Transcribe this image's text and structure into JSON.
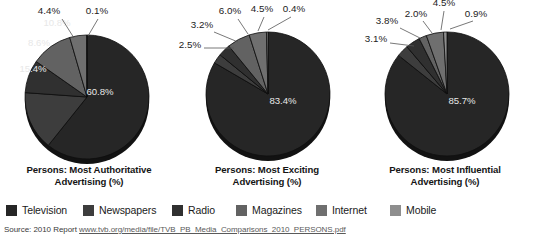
{
  "figure": {
    "source_prefix": "Source:  2010 Report",
    "source_url": "www.tvb.org/media/file/TVB_PB_Media_Comparisons_2010_PERSONS.pdf"
  },
  "legend": {
    "items": [
      {
        "label": "Television",
        "color": "#262626"
      },
      {
        "label": "Newspapers",
        "color": "#3d3d3d"
      },
      {
        "label": "Radio",
        "color": "#303030"
      },
      {
        "label": "Magazines",
        "color": "#626262"
      },
      {
        "label": "Internet",
        "color": "#6f6f6f"
      },
      {
        "label": "Mobile",
        "color": "#8e8e8e"
      }
    ]
  },
  "chart_data": [
    {
      "type": "pie",
      "title": "Persons: Most Authoritative\nAdvertising (%)",
      "title_line1": "Persons: Most Authoritative",
      "title_line2": "Advertising (%)",
      "categories": [
        "Television",
        "Newspapers",
        "Radio",
        "Magazines",
        "Internet",
        "Mobile"
      ],
      "values": [
        60.8,
        15.4,
        8.6,
        10.8,
        4.4,
        0.1
      ],
      "labels": [
        "60.8%",
        "15.4%",
        "8.6%",
        "10.8%",
        "4.4%",
        "0.1%"
      ],
      "colors": [
        "#262626",
        "#3d3d3d",
        "#303030",
        "#626262",
        "#6f6f6f",
        "#8e8e8e"
      ],
      "legend_position": "bottom-shared",
      "start_angle_deg": 0
    },
    {
      "type": "pie",
      "title": "Persons: Most Exciting\nAdvertising (%)",
      "title_line1": "Persons: Most Exciting",
      "title_line2": "Advertising (%)",
      "categories": [
        "Television",
        "Newspapers",
        "Radio",
        "Magazines",
        "Internet",
        "Mobile"
      ],
      "values": [
        83.4,
        2.5,
        3.2,
        6.0,
        4.5,
        0.4
      ],
      "labels": [
        "83.4%",
        "2.5%",
        "3.2%",
        "6.0%",
        "4.5%",
        "0.4%"
      ],
      "colors": [
        "#262626",
        "#3d3d3d",
        "#303030",
        "#626262",
        "#6f6f6f",
        "#8e8e8e"
      ],
      "legend_position": "bottom-shared",
      "start_angle_deg": 0
    },
    {
      "type": "pie",
      "title": "Persons: Most Influential\nAdvertising (%)",
      "title_line1": "Persons: Most Influential",
      "title_line2": "Advertising (%)",
      "categories": [
        "Television",
        "Newspapers",
        "Radio",
        "Magazines",
        "Internet",
        "Mobile"
      ],
      "values": [
        85.7,
        3.1,
        3.8,
        2.0,
        4.5,
        0.9
      ],
      "labels": [
        "85.7%",
        "3.1%",
        "3.8%",
        "2.0%",
        "4.5%",
        "0.9%"
      ],
      "colors": [
        "#262626",
        "#3d3d3d",
        "#303030",
        "#626262",
        "#6f6f6f",
        "#8e8e8e"
      ],
      "legend_position": "bottom-shared",
      "start_angle_deg": 0
    }
  ]
}
